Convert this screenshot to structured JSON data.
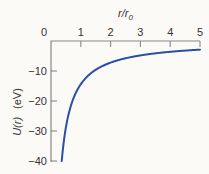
{
  "chart_data": {
    "type": "line",
    "title": "",
    "xlabel": "r/r0",
    "xlabel_parts": {
      "main": "r/r",
      "sub": "0"
    },
    "ylabel": "U(r)   (eV)",
    "ylabel_parts": {
      "func": "U(r)",
      "unit": "(eV)"
    },
    "xlim": [
      0,
      5
    ],
    "ylim": [
      -40,
      0
    ],
    "x_ticks": [
      0,
      1,
      2,
      3,
      4,
      5
    ],
    "x_tick_labels": [
      "0",
      "1",
      "2",
      "3",
      "4",
      "5"
    ],
    "x_axis_position": "top",
    "y_ticks": [
      0,
      -10,
      -20,
      -30,
      -40
    ],
    "y_tick_labels": [
      "0",
      "−10",
      "−20",
      "−30",
      "−40"
    ],
    "grid": false,
    "legend": null,
    "series": [
      {
        "name": "U(r)",
        "color": "#2b4fa6",
        "formula": "U = -14.4 / (r/r0)",
        "x": [
          0.36,
          0.4,
          0.5,
          0.6,
          0.7,
          0.8,
          1.0,
          1.2,
          1.5,
          2.0,
          2.5,
          3.0,
          3.5,
          4.0,
          4.5,
          5.0
        ],
        "y": [
          -40.0,
          -36.0,
          -28.8,
          -24.0,
          -20.6,
          -18.0,
          -14.4,
          -12.0,
          -9.6,
          -7.2,
          -5.8,
          -4.8,
          -4.1,
          -3.6,
          -3.2,
          -2.9
        ]
      }
    ]
  },
  "colors": {
    "background": "#fbfaf7",
    "axis": "#888888",
    "text": "#333333",
    "curve": "#2b4fa6"
  }
}
